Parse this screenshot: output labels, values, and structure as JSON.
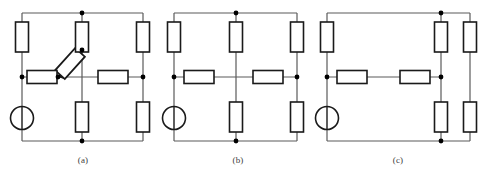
{
  "figure": {
    "width": 489,
    "height": 176,
    "background_color": "#ffffff",
    "wire_color": "#5a5a5a",
    "component_color": "#1a1a1a",
    "node_color": "#000000"
  },
  "captions": {
    "a": "(a)",
    "b": "(b)",
    "c": "(c)"
  },
  "circuits": [
    {
      "id": "a",
      "label": "(a)",
      "components": {
        "source": {
          "type": "voltage-source-circle",
          "count": 1
        },
        "resistors_vertical": 5,
        "resistors_horizontal": 2,
        "variable_resistor_diagonal": 1
      },
      "nodes": 6
    },
    {
      "id": "b",
      "label": "(b)",
      "components": {
        "source": {
          "type": "voltage-source-circle",
          "count": 1
        },
        "resistors_vertical": 5,
        "resistors_horizontal": 2,
        "variable_resistor_diagonal": 0
      },
      "nodes": 5
    },
    {
      "id": "c",
      "label": "(c)",
      "components": {
        "source": {
          "type": "voltage-source-circle",
          "count": 1
        },
        "resistors_vertical": 5,
        "resistors_horizontal": 2,
        "variable_resistor_diagonal": 0
      },
      "nodes": 5
    }
  ]
}
